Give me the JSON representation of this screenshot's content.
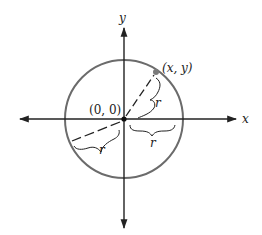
{
  "diagram": {
    "type": "circle-on-coordinate-axes",
    "axes": {
      "x_label": "x",
      "y_label": "y"
    },
    "origin_label": "(0, 0)",
    "point_label": "(x, y)",
    "radius_labels": [
      "r",
      "r",
      "r"
    ],
    "colors": {
      "circle": "#6b6b6b",
      "axes": "#222222",
      "point": "#7a7a7a",
      "text": "#222222"
    }
  }
}
